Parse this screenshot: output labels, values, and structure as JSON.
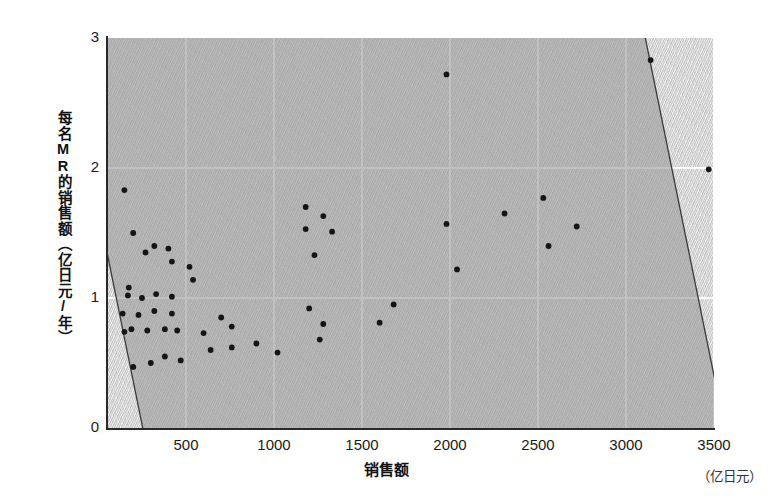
{
  "chart_data": {
    "type": "scatter",
    "title": "",
    "xlabel": "销售额",
    "xunit": "（亿日元）",
    "ylabel": "每名MR的销售额（亿日元/年）",
    "xlim": [
      0,
      3500
    ],
    "ylim": [
      0,
      3
    ],
    "xticks": [
      500,
      1000,
      1500,
      2000,
      2500,
      3000,
      3500
    ],
    "yticks": [
      0,
      1,
      2,
      3
    ],
    "grid": true,
    "legend": "none",
    "point_color": "#151515",
    "plot_bg_color": "#d2d2d2",
    "grid_color": "#ffffff",
    "ellipse_fill": "#9b9b9b",
    "ellipse_stroke": "#3a3a3a",
    "annotations": [
      {
        "shape": "ellipse",
        "center_x": 1700,
        "center_y": 1.38,
        "semi_major": 1620,
        "semi_minor": 370,
        "rotation_deg": -11.5,
        "label": "correlation-ellipse"
      }
    ],
    "points": [
      {
        "x": 150,
        "y": 1.83
      },
      {
        "x": 200,
        "y": 1.5
      },
      {
        "x": 270,
        "y": 1.35
      },
      {
        "x": 175,
        "y": 1.08
      },
      {
        "x": 320,
        "y": 1.4
      },
      {
        "x": 400,
        "y": 1.38
      },
      {
        "x": 420,
        "y": 1.28
      },
      {
        "x": 170,
        "y": 1.02
      },
      {
        "x": 250,
        "y": 1.0
      },
      {
        "x": 330,
        "y": 1.03
      },
      {
        "x": 420,
        "y": 1.01
      },
      {
        "x": 140,
        "y": 0.88
      },
      {
        "x": 230,
        "y": 0.87
      },
      {
        "x": 320,
        "y": 0.9
      },
      {
        "x": 420,
        "y": 0.88
      },
      {
        "x": 150,
        "y": 0.74
      },
      {
        "x": 190,
        "y": 0.76
      },
      {
        "x": 280,
        "y": 0.75
      },
      {
        "x": 380,
        "y": 0.76
      },
      {
        "x": 450,
        "y": 0.75
      },
      {
        "x": 520,
        "y": 1.24
      },
      {
        "x": 540,
        "y": 1.14
      },
      {
        "x": 600,
        "y": 0.73
      },
      {
        "x": 700,
        "y": 0.85
      },
      {
        "x": 760,
        "y": 0.78
      },
      {
        "x": 200,
        "y": 0.47
      },
      {
        "x": 300,
        "y": 0.5
      },
      {
        "x": 380,
        "y": 0.55
      },
      {
        "x": 470,
        "y": 0.52
      },
      {
        "x": 640,
        "y": 0.6
      },
      {
        "x": 760,
        "y": 0.62
      },
      {
        "x": 900,
        "y": 0.65
      },
      {
        "x": 1020,
        "y": 0.58
      },
      {
        "x": 1180,
        "y": 1.7
      },
      {
        "x": 1280,
        "y": 1.63
      },
      {
        "x": 1180,
        "y": 1.53
      },
      {
        "x": 1330,
        "y": 1.51
      },
      {
        "x": 1230,
        "y": 1.33
      },
      {
        "x": 1200,
        "y": 0.92
      },
      {
        "x": 1280,
        "y": 0.8
      },
      {
        "x": 1260,
        "y": 0.68
      },
      {
        "x": 1600,
        "y": 0.81
      },
      {
        "x": 1680,
        "y": 0.95
      },
      {
        "x": 1980,
        "y": 2.72
      },
      {
        "x": 1980,
        "y": 1.57
      },
      {
        "x": 2040,
        "y": 1.22
      },
      {
        "x": 2310,
        "y": 1.65
      },
      {
        "x": 2530,
        "y": 1.77
      },
      {
        "x": 2560,
        "y": 1.4
      },
      {
        "x": 2720,
        "y": 1.55
      },
      {
        "x": 3140,
        "y": 2.83
      },
      {
        "x": 3470,
        "y": 1.99
      }
    ]
  }
}
